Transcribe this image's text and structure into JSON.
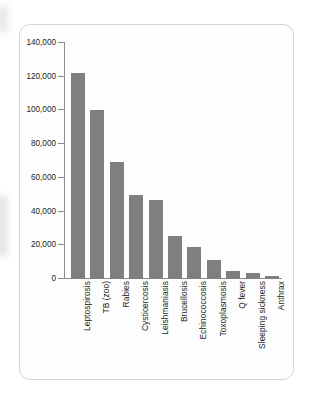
{
  "chart_data": {
    "type": "bar",
    "title": "",
    "xlabel": "",
    "ylabel": "",
    "ylim": [
      0,
      140000
    ],
    "grid": false,
    "legend": null,
    "bar_color": "#7d7f81",
    "y_ticks": [
      "0",
      "20,000",
      "40,000",
      "60,000",
      "80,000",
      "100,000",
      "120,000",
      "140,000"
    ],
    "y_tick_values": [
      0,
      20000,
      40000,
      60000,
      80000,
      100000,
      120000,
      140000
    ],
    "categories": [
      "Leptospirosis",
      "TB (zoo)",
      "Rabies",
      "Cysticercosis",
      "Leishmaniasis",
      "Brucellosis",
      "Echinococcosis",
      "Toxoplasmosis",
      "Q fever",
      "Sleeping sickness",
      "Anthrax"
    ],
    "values": [
      122000,
      100000,
      69500,
      50000,
      47000,
      25500,
      19000,
      11000,
      4500,
      3500,
      2000
    ]
  }
}
